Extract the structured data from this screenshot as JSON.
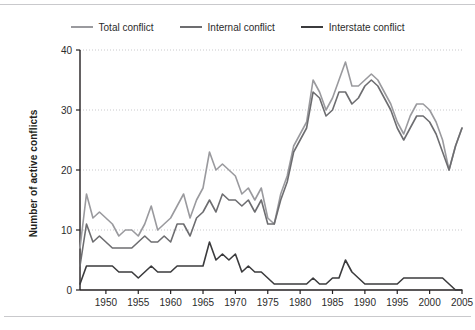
{
  "chart_data": {
    "type": "line",
    "title": "",
    "xlabel": "",
    "ylabel": "Number of active conflicts",
    "xlim": [
      1946,
      2005
    ],
    "ylim": [
      0,
      40
    ],
    "yticks": [
      0,
      10,
      20,
      30,
      40
    ],
    "xticks": [
      1950,
      1955,
      1960,
      1965,
      1970,
      1975,
      1980,
      1985,
      1990,
      1995,
      2000,
      2005
    ],
    "grid": "horizontal-dotted",
    "legend_position": "top-center",
    "x": [
      1946,
      1947,
      1948,
      1949,
      1950,
      1951,
      1952,
      1953,
      1954,
      1955,
      1956,
      1957,
      1958,
      1959,
      1960,
      1961,
      1962,
      1963,
      1964,
      1965,
      1966,
      1967,
      1968,
      1969,
      1970,
      1971,
      1972,
      1973,
      1974,
      1975,
      1976,
      1977,
      1978,
      1979,
      1980,
      1981,
      1982,
      1983,
      1984,
      1985,
      1986,
      1987,
      1988,
      1989,
      1990,
      1991,
      1992,
      1993,
      1994,
      1995,
      1996,
      1997,
      1998,
      1999,
      2000,
      2001,
      2002,
      2003,
      2004,
      2005
    ],
    "series": [
      {
        "name": "Total conflict",
        "color": "#9a9a9e",
        "values": [
          7,
          16,
          12,
          13,
          12,
          11,
          9,
          10,
          10,
          9,
          11,
          14,
          10,
          11,
          12,
          14,
          16,
          12,
          15,
          17,
          23,
          20,
          21,
          20,
          19,
          16,
          17,
          15,
          17,
          12,
          11,
          16,
          19,
          24,
          26,
          28,
          35,
          33,
          30,
          32,
          35,
          38,
          34,
          34,
          35,
          36,
          35,
          33,
          31,
          28,
          26,
          29,
          31,
          31,
          30,
          28,
          25,
          20,
          24,
          27
        ]
      },
      {
        "name": "Internal conflict",
        "color": "#6d6d70",
        "values": [
          4,
          11,
          8,
          9,
          8,
          7,
          7,
          7,
          7,
          8,
          9,
          8,
          8,
          9,
          8,
          11,
          11,
          9,
          12,
          13,
          15,
          13,
          16,
          15,
          15,
          14,
          15,
          13,
          15,
          11,
          11,
          15,
          18,
          23,
          25,
          27,
          33,
          32,
          29,
          30,
          33,
          33,
          31,
          32,
          34,
          35,
          34,
          32,
          30,
          27,
          25,
          27,
          29,
          29,
          28,
          26,
          23,
          20,
          24,
          27
        ]
      },
      {
        "name": "Interstate conflict",
        "color": "#3b3b3d",
        "values": [
          1,
          4,
          4,
          4,
          4,
          4,
          3,
          3,
          3,
          2,
          3,
          4,
          3,
          3,
          3,
          4,
          4,
          4,
          4,
          4,
          8,
          5,
          6,
          5,
          6,
          3,
          4,
          3,
          3,
          2,
          1,
          1,
          1,
          1,
          1,
          1,
          2,
          1,
          1,
          2,
          2,
          5,
          3,
          2,
          1,
          1,
          1,
          1,
          1,
          1,
          2,
          2,
          2,
          2,
          2,
          2,
          2,
          1,
          0,
          0
        ]
      }
    ]
  },
  "legend": {
    "items": [
      {
        "label": "Total conflict",
        "color": "#9a9a9e"
      },
      {
        "label": "Internal conflict",
        "color": "#6d6d70"
      },
      {
        "label": "Interstate conflict",
        "color": "#3b3b3d"
      }
    ]
  },
  "axis": {
    "y_label": "Number of active conflicts",
    "y_tick_labels": [
      "0",
      "10",
      "20",
      "30",
      "40"
    ],
    "x_tick_labels": [
      "1950",
      "1955",
      "1960",
      "1965",
      "1970",
      "1975",
      "1980",
      "1985",
      "1990",
      "1995",
      "2000",
      "2005"
    ]
  }
}
